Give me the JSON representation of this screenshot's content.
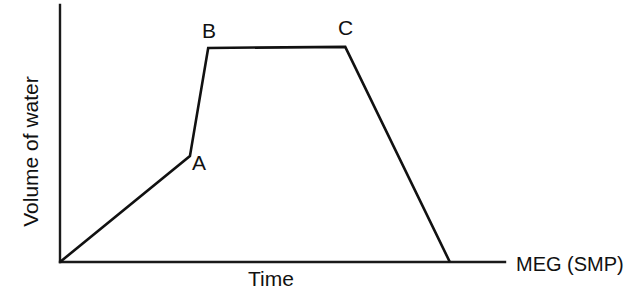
{
  "figure": {
    "background_color": "#ffffff",
    "line_color": "#111111",
    "axis_color": "#1a1a1a"
  },
  "axes": {
    "ylabel": "Volume of water",
    "xlabel": "Time",
    "corner_label": "MEG (SMP)"
  },
  "annotations": {
    "a": "A",
    "b": "B",
    "c": "C"
  },
  "chart_data": {
    "type": "line",
    "title": "",
    "xlabel": "Time",
    "ylabel": "Volume of water",
    "grid": false,
    "legend": null,
    "axis_ticks": {
      "x": [],
      "y": []
    },
    "xlim": [
      0,
      1
    ],
    "ylim": [
      0,
      1
    ],
    "annotations": [
      {
        "label": "A",
        "x": 0.292,
        "y": 0.412
      },
      {
        "label": "B",
        "x": 0.333,
        "y": 0.833
      },
      {
        "label": "C",
        "x": 0.641,
        "y": 0.837
      }
    ],
    "series": [
      {
        "name": "Volume of water vs Time",
        "points": [
          {
            "x": 0.0,
            "y": 0.0,
            "label": "origin"
          },
          {
            "x": 0.292,
            "y": 0.412,
            "label": "A"
          },
          {
            "x": 0.333,
            "y": 0.833,
            "label": "B"
          },
          {
            "x": 0.641,
            "y": 0.837,
            "label": "C"
          },
          {
            "x": 0.876,
            "y": 0.0,
            "label": "end"
          }
        ]
      }
    ]
  }
}
